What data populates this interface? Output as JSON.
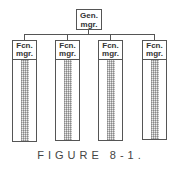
{
  "diagram": {
    "root": {
      "line1": "Gen.",
      "line2": "mgr."
    },
    "children": [
      {
        "line1": "Fcn.",
        "line2": "mgr."
      },
      {
        "line1": "Fcn.",
        "line2": "mgr."
      },
      {
        "line1": "Fcn.",
        "line2": "mgr."
      },
      {
        "line1": "Fcn.",
        "line2": "mgr."
      }
    ]
  },
  "caption": "FIGURE 8-1."
}
